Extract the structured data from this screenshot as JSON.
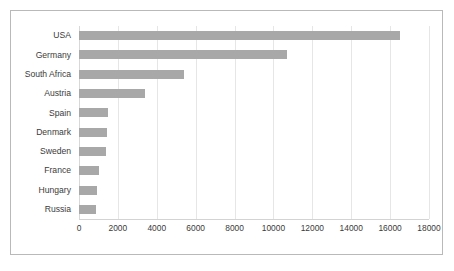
{
  "chart_data": {
    "type": "bar",
    "orientation": "horizontal",
    "title": "",
    "subtitle": "",
    "xlabel": "",
    "ylabel": "",
    "categories": [
      "USA",
      "Germany",
      "South Africa",
      "Austria",
      "Spain",
      "Denmark",
      "Sweden",
      "France",
      "Hungary",
      "Russia"
    ],
    "values": [
      16500,
      10700,
      5400,
      3400,
      1500,
      1450,
      1400,
      1050,
      900,
      880
    ],
    "series": [
      {
        "name": "",
        "values": [
          16500,
          10700,
          5400,
          3400,
          1500,
          1450,
          1400,
          1050,
          900,
          880
        ]
      }
    ],
    "xlim": [
      0,
      18000
    ],
    "xticks": [
      0,
      2000,
      4000,
      6000,
      8000,
      10000,
      12000,
      14000,
      16000,
      18000
    ],
    "xtick_labels": [
      "0",
      "2000",
      "4000",
      "6000",
      "8000",
      "10000",
      "12000",
      "14000",
      "16000",
      "18000"
    ],
    "grid": "vertical",
    "legend": "none",
    "bar_color": "#a8a8a8",
    "gridline_color": "#e6e6e6",
    "border_color": "#b9b9b9",
    "text_color": "#3b3b3b"
  }
}
